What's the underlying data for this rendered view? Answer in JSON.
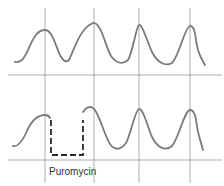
{
  "figure": {
    "top_panel": {
      "name": "control-trace"
    },
    "bottom_panel": {
      "name": "puromycin-trace",
      "annotation": "Puromycin"
    }
  },
  "colors": {
    "wave": "#7a7a7a",
    "dash": "#2a2a2a",
    "grid": "#8a8a8a"
  }
}
